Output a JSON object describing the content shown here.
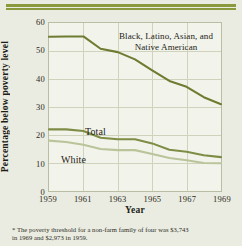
{
  "chart_data": {
    "type": "line",
    "title": "",
    "xlabel": "Year",
    "ylabel": "Percentage below poverty level",
    "xlim": [
      1959,
      1969
    ],
    "ylim": [
      0,
      60
    ],
    "ytick_labels": [
      "60",
      "50",
      "40",
      "30",
      "20",
      "10",
      "0"
    ],
    "yticks": [
      60,
      50,
      40,
      30,
      20,
      10,
      0
    ],
    "xtick_labels": [
      "1959",
      "1961",
      "1963",
      "1965",
      "1967",
      "1969"
    ],
    "xticks": [
      1959,
      1961,
      1963,
      1965,
      1967,
      1969
    ],
    "grid": true,
    "legend_position": "inline-annotations",
    "x": [
      1959,
      1960,
      1961,
      1962,
      1963,
      1964,
      1965,
      1966,
      1967,
      1968,
      1969
    ],
    "series": [
      {
        "name": "Black, Latino, Asian, and Native American",
        "color": "#6d7c31",
        "values": [
          55.1,
          55.2,
          55.2,
          50.8,
          49.6,
          47.0,
          43.1,
          39.3,
          37.2,
          33.5,
          31.0
        ]
      },
      {
        "name": "Total",
        "color": "#7e8d46",
        "values": [
          22.0,
          22.0,
          21.4,
          19.0,
          18.5,
          18.5,
          17.0,
          14.7,
          14.0,
          12.8,
          12.1
        ]
      },
      {
        "name": "White",
        "color": "#b9c49a",
        "values": [
          18.0,
          17.5,
          16.5,
          15.0,
          14.6,
          14.6,
          13.2,
          11.8,
          11.0,
          10.0,
          9.9
        ]
      }
    ],
    "annotations": [
      {
        "id": "series-label-minority",
        "text_line_1": "Black, Latino, Asian, and",
        "text_line_2": "Native American"
      },
      {
        "id": "series-label-total",
        "text": "Total"
      },
      {
        "id": "series-label-white",
        "text": "White"
      }
    ]
  },
  "footnote": {
    "line1": "* The poverty threshold for a non-farm family of four was  $3,743",
    "line2": "in 1969 and $2,973 in 1959."
  },
  "colors": {
    "background": "#eaece1",
    "plot_background": "#f2f3ea",
    "rule": "#8a9a3d",
    "grid": "#cfd3bc",
    "axis": "#b9bda4"
  }
}
